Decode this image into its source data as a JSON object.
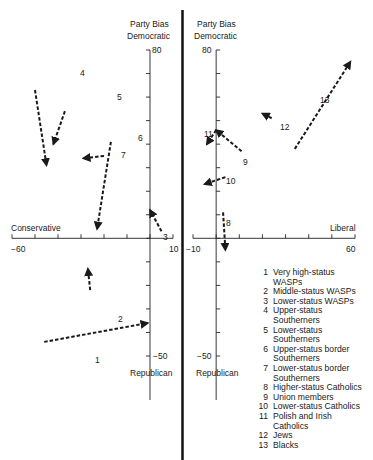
{
  "chart_data": [
    {
      "type": "scatter",
      "title": "",
      "panel": "left",
      "xlabel": "Conservative",
      "ylabel_top": "Party Bias Democratic",
      "ylabel_bottom": "Republican",
      "xlim": [
        -60,
        10
      ],
      "ylim": [
        -50,
        80
      ],
      "x_tick_labels": [
        "-60",
        "10"
      ],
      "y_tick_labels": [
        "80",
        "-50"
      ],
      "y_tick_step": 10,
      "x_tick_step": 10,
      "arrows": [
        {
          "id": "1",
          "from": [
            -46,
            -44
          ],
          "to": [
            -1,
            -36
          ]
        },
        {
          "id": "2",
          "from": [
            -26,
            -22
          ],
          "to": [
            -27,
            -13
          ]
        },
        {
          "id": "3",
          "from": [
            5,
            3
          ],
          "to": [
            0,
            12
          ]
        },
        {
          "id": "4",
          "from": [
            -50,
            63
          ],
          "to": [
            -45,
            31
          ]
        },
        {
          "id": "5",
          "from": [
            -37,
            54
          ],
          "to": [
            -42,
            40
          ]
        },
        {
          "id": "6",
          "from": [
            -17,
            41
          ],
          "to": [
            -23,
            4
          ]
        },
        {
          "id": "7",
          "from": [
            -20,
            35
          ],
          "to": [
            -29,
            34
          ]
        }
      ]
    },
    {
      "type": "scatter",
      "title": "",
      "panel": "right",
      "xlabel": "Liberal",
      "ylabel_top": "Party Bias Democratic",
      "ylabel_bottom": "Republican",
      "xlim": [
        -10,
        60
      ],
      "ylim": [
        -50,
        80
      ],
      "x_tick_labels": [
        "-10",
        "60"
      ],
      "y_tick_labels": [
        "80",
        "-50"
      ],
      "y_tick_step": 10,
      "x_tick_step": 10,
      "arrows": [
        {
          "id": "8",
          "from": [
            3,
            11
          ],
          "to": [
            4,
            -5
          ]
        },
        {
          "id": "9",
          "from": [
            11,
            37
          ],
          "to": [
            0,
            46
          ]
        },
        {
          "id": "10",
          "from": [
            4,
            26
          ],
          "to": [
            -5,
            23
          ]
        },
        {
          "id": "11",
          "from": [
            0,
            46
          ],
          "to": [
            -4,
            40
          ]
        },
        {
          "id": "12",
          "from": [
            24,
            51
          ],
          "to": [
            20,
            53
          ]
        },
        {
          "id": "13",
          "from": [
            34,
            38
          ],
          "to": [
            58,
            75
          ]
        }
      ]
    }
  ],
  "labels": {
    "left_y_top_1": "Party Bias",
    "left_y_top_2": "Democratic",
    "left_y_max": "80",
    "left_y_min": "−50",
    "left_y_bottom": "Republican",
    "left_x_label": "Conservative",
    "left_x_min": "−60",
    "left_x_max": "10",
    "right_y_top_1": "Party Bias",
    "right_y_top_2": "Democratic",
    "right_y_max": "80",
    "right_y_min": "−50",
    "right_y_bottom": "Republican",
    "right_x_label": "Liberal",
    "right_x_min": "−10",
    "right_x_max": "60"
  },
  "legend": [
    {
      "num": "1",
      "text": "Very high-status\n  WASPs"
    },
    {
      "num": "2",
      "text": "Middle-status WASPs"
    },
    {
      "num": "3",
      "text": "Lower-status WASPs"
    },
    {
      "num": "4",
      "text": "Upper-status\n  Southerners"
    },
    {
      "num": "5",
      "text": "Lower-status\n  Southerners"
    },
    {
      "num": "6",
      "text": "Upper-status border\n  Southerners"
    },
    {
      "num": "7",
      "text": "Lower-status border\n  Southerners"
    },
    {
      "num": "8",
      "text": "Higher-status Catholics"
    },
    {
      "num": "9",
      "text": "Union members"
    },
    {
      "num": "10",
      "text": "Lower-status Catholics"
    },
    {
      "num": "11",
      "text": "Polish and Irish\n  Catholics"
    },
    {
      "num": "12",
      "text": "Jews"
    },
    {
      "num": "13",
      "text": "Blacks"
    }
  ],
  "arrow_label_positions": {
    "1": [
      95,
      355
    ],
    "2": [
      118,
      314
    ],
    "3": [
      163,
      232
    ],
    "4": [
      80,
      68
    ],
    "5": [
      117,
      92
    ],
    "6": [
      138,
      133
    ],
    "7": [
      121,
      150
    ],
    "8": [
      226,
      218
    ],
    "9": [
      243,
      157
    ],
    "10": [
      226,
      176
    ],
    "11": [
      204,
      129
    ],
    "12": [
      280,
      122
    ],
    "13": [
      320,
      95
    ]
  }
}
